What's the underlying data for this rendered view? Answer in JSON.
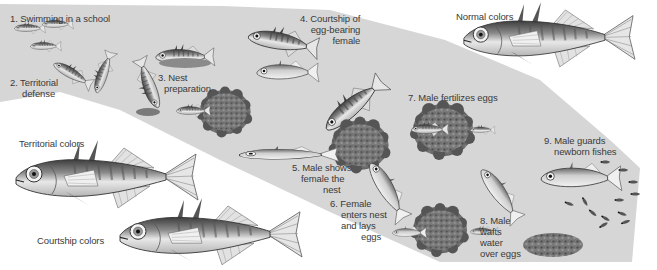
{
  "figure": {
    "colors": {
      "background": "#ffffff",
      "band": "#d6d6d6",
      "fish_dark": "#4a4a4a",
      "fish_light": "#efefef",
      "nest": "#6e6e6e",
      "text": "#3a3a3a"
    }
  },
  "steps": [
    {
      "id": 1,
      "lines": [
        "1. Swimming in a school"
      ]
    },
    {
      "id": 2,
      "lines": [
        "2. Territorial",
        "defense"
      ]
    },
    {
      "id": 3,
      "lines": [
        "3. Nest",
        "preparation"
      ]
    },
    {
      "id": 4,
      "lines": [
        "4. Courtship of",
        "egg-bearing",
        "female"
      ]
    },
    {
      "id": 5,
      "lines": [
        "5. Male shows",
        "female the",
        "nest"
      ]
    },
    {
      "id": 6,
      "lines": [
        "6. Female",
        "enters nest",
        "and lays",
        "eggs"
      ]
    },
    {
      "id": 7,
      "lines": [
        "7. Male fertilizes eggs"
      ]
    },
    {
      "id": 8,
      "lines": [
        "8. Male",
        "wafts",
        "water",
        "over eggs"
      ]
    },
    {
      "id": 9,
      "lines": [
        "9. Male guards",
        "newborn fishes"
      ]
    }
  ],
  "coloration": [
    {
      "label": "Normal colors"
    },
    {
      "label": "Territorial colors"
    },
    {
      "label": "Courtship colors"
    }
  ]
}
